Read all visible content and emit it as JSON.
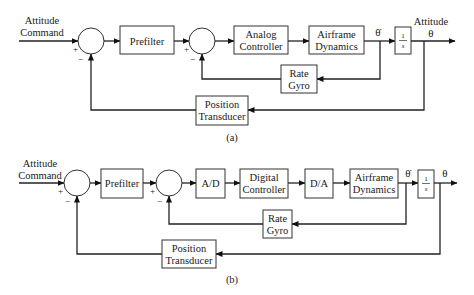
{
  "figure": {
    "diagram_a": {
      "caption": "(a)",
      "input_label": [
        "Attitude",
        "Command"
      ],
      "output_label": [
        "Attitude",
        "θ"
      ],
      "rate_signal_label": "θ̇",
      "summer_1": {
        "plus": "+",
        "minus": "−"
      },
      "summer_2": {
        "plus": "+",
        "minus": "−"
      },
      "blocks": {
        "prefilter": [
          "Prefilter"
        ],
        "controller": [
          "Analog",
          "Controller"
        ],
        "airframe": [
          "Airframe",
          "Dynamics"
        ],
        "integrator": {
          "num": "1",
          "den": "s"
        },
        "rate_gyro": [
          "Rate",
          "Gyro"
        ],
        "position_transducer": [
          "Position",
          "Transducer"
        ]
      }
    },
    "diagram_b": {
      "caption": "(b)",
      "input_label": [
        "Attitude",
        "Command"
      ],
      "output_label": "θ",
      "rate_signal_label": "θ̇",
      "summer_1": {
        "plus": "+",
        "minus": "−"
      },
      "summer_2": {
        "plus": "+",
        "minus": "−"
      },
      "blocks": {
        "prefilter": [
          "Prefilter"
        ],
        "adc": [
          "A/D"
        ],
        "controller": [
          "Digital",
          "Controller"
        ],
        "dac": [
          "D/A"
        ],
        "airframe": [
          "Airframe",
          "Dynamics"
        ],
        "integrator": {
          "num": "1",
          "den": "s"
        },
        "rate_gyro": [
          "Rate",
          "Gyro"
        ],
        "position_transducer": [
          "Position",
          "Transducer"
        ]
      }
    }
  }
}
